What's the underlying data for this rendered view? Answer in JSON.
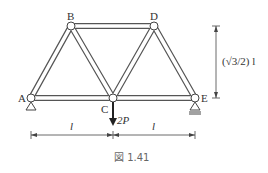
{
  "figure": {
    "caption": "図 1.41",
    "nodes": {
      "A": "A",
      "B": "B",
      "C": "C",
      "D": "D",
      "E": "E"
    },
    "load_label": "2P",
    "span_left": "l",
    "span_right": "l",
    "height_label": "(√3/2) l"
  }
}
